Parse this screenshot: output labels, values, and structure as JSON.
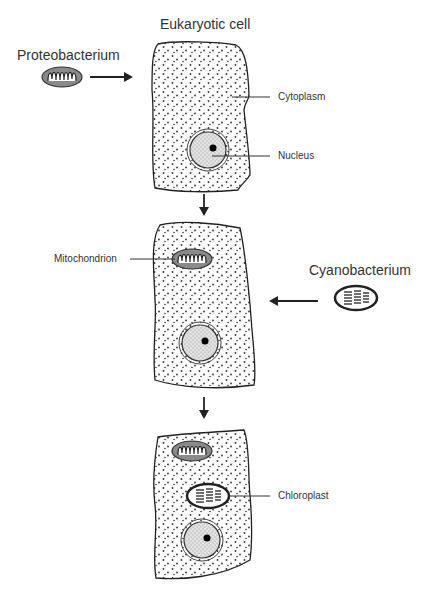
{
  "diagram": {
    "labels": {
      "eukaryotic_cell": "Eukaryotic cell",
      "proteobacterium": "Proteobacterium",
      "cytoplasm": "Cytoplasm",
      "nucleus": "Nucleus",
      "mitochondrion": "Mitochondrion",
      "cyanobacterium": "Cyanobacterium",
      "chloroplast": "Chloroplast"
    },
    "stages": [
      {
        "name": "stage-1",
        "organelles": [
          "nucleus"
        ]
      },
      {
        "name": "stage-2",
        "organelles": [
          "nucleus",
          "mitochondrion"
        ]
      },
      {
        "name": "stage-3",
        "organelles": [
          "nucleus",
          "mitochondrion",
          "chloroplast"
        ]
      }
    ],
    "colors": {
      "outline": "#222222",
      "stipple": "#333333",
      "mito_fill": "#8a8a8a",
      "nucleus_fill": "#d9d9d9",
      "label": "#333333"
    }
  }
}
